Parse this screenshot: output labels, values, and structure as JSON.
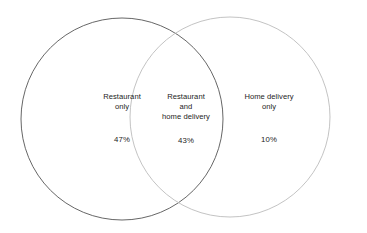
{
  "chart_data": {
    "type": "venn",
    "title": "",
    "sets": [
      {
        "id": "restaurant-only",
        "label_lines": [
          "Restaurant",
          "only"
        ],
        "value_label": "47%",
        "value": 47,
        "stroke": "#555555"
      },
      {
        "id": "restaurant-and-home-delivery",
        "label_lines": [
          "Restaurant",
          "and",
          "home delivery"
        ],
        "value_label": "43%",
        "value": 43,
        "stroke": "#8a8a8a"
      },
      {
        "id": "home-delivery-only",
        "label_lines": [
          "Home delivery",
          "only"
        ],
        "value_label": "10%",
        "value": 10,
        "stroke": "#bcbcbc"
      }
    ],
    "units": "percent",
    "total": 100,
    "legend": "none",
    "grid": false,
    "background": "#ffffff"
  },
  "diagram": {
    "left_circle": {
      "cx": 122,
      "cy": 119,
      "r": 101,
      "stroke": "#555555"
    },
    "right_circle": {
      "cx": 230,
      "cy": 117,
      "r": 100,
      "stroke": "#bcbcbc"
    }
  },
  "regions": {
    "left": {
      "line1": "Restaurant",
      "line2": "only",
      "percent": "47%"
    },
    "center": {
      "line1": "Restaurant",
      "line2": "and",
      "line3": "home delivery",
      "percent": "43%"
    },
    "right": {
      "line1": "Home delivery",
      "line2": "only",
      "percent": "10%"
    }
  }
}
